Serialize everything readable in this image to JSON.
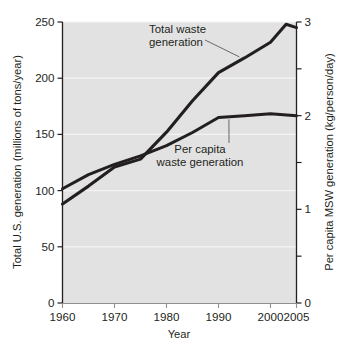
{
  "chart_data": {
    "type": "line",
    "title": "",
    "subtitle": "",
    "xlabel": "Year",
    "ylabel": "Total U.S. generation (millions of tons/year)",
    "y2label": "Per capita MSW generation (kg/person/day)",
    "xlim": [
      1960,
      2005
    ],
    "ylim": [
      0,
      250
    ],
    "y2lim": [
      0,
      3
    ],
    "xticks": [
      1960,
      1970,
      1980,
      1990,
      2000,
      2005
    ],
    "xticklabels": [
      "1960",
      "1970",
      "1980",
      "1990",
      "2000",
      "2005"
    ],
    "yticks": [
      0,
      50,
      100,
      150,
      200,
      250
    ],
    "yticklabels": [
      "0",
      "50",
      "100",
      "150",
      "200",
      "250"
    ],
    "y2ticks": [
      0,
      0.5,
      1,
      1.5,
      2,
      2.5,
      3
    ],
    "y2ticklabels": [
      "0",
      "",
      "1",
      "",
      "2",
      "",
      "3"
    ],
    "grid": true,
    "grid_color": "#f4f4f4",
    "plot_bg": "#e2e2e2",
    "line_color": "#231f20",
    "legend": "none",
    "annotations": [
      {
        "id": "total-waste-annotation",
        "text_line1": "Total waste",
        "text_line2": "generation",
        "points_to_year": 1994,
        "points_to_value": 219
      },
      {
        "id": "per-capita-annotation",
        "text_line1": "Per capita",
        "text_line2": "waste generation",
        "points_to_year": 1992,
        "points_to_value": 166
      }
    ],
    "series": [
      {
        "name": "Total waste generation",
        "axis": "left",
        "unit": "millions of tons/year",
        "x": [
          1960,
          1965,
          1970,
          1975,
          1980,
          1985,
          1990,
          1995,
          2000,
          2003,
          2005
        ],
        "values": [
          88,
          104,
          121,
          128,
          152,
          180,
          205,
          218,
          232,
          248,
          245
        ]
      },
      {
        "name": "Per capita waste generation",
        "axis": "right",
        "unit": "kg/person/day",
        "x": [
          1960,
          1965,
          1970,
          1975,
          1980,
          1985,
          1990,
          1995,
          2000,
          2005
        ],
        "values": [
          1.22,
          1.37,
          1.48,
          1.57,
          1.68,
          1.82,
          1.98,
          2.0,
          2.02,
          2.0
        ],
        "values_left_scale": [
          102,
          114,
          123,
          131,
          140,
          152,
          165,
          167,
          168,
          167
        ]
      }
    ]
  }
}
